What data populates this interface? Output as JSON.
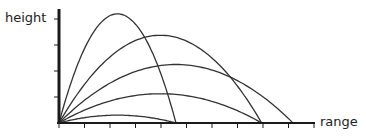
{
  "chart_data": {
    "type": "line",
    "title": "",
    "xlabel": "range",
    "ylabel": "height",
    "axis_color": "#1a1a1a",
    "curve_color": "#333333",
    "x_ticks": 10,
    "y_ticks": 4,
    "grid": false,
    "legend": false,
    "max_range": 234,
    "series": [
      {
        "name": "15°",
        "angle_deg": 15,
        "range": 117,
        "peak_height": 7.8
      },
      {
        "name": "30°",
        "angle_deg": 30,
        "range": 203,
        "peak_height": 29.3
      },
      {
        "name": "45°",
        "angle_deg": 45,
        "range": 234,
        "peak_height": 58.5
      },
      {
        "name": "60°",
        "angle_deg": 60,
        "range": 203,
        "peak_height": 87.8
      },
      {
        "name": "75°",
        "angle_deg": 75,
        "range": 117,
        "peak_height": 109.2
      }
    ]
  }
}
